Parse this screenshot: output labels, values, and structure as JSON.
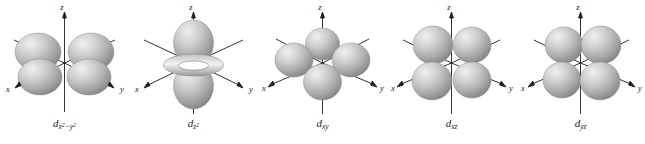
{
  "figure": {
    "caption_style": "italic-serif",
    "background_color": "#ffffff",
    "lobe_fill_light": "#e8e8e8",
    "lobe_fill_mid": "#b4b4b4",
    "lobe_fill_dark": "#8a8a8a",
    "axis_color": "#1c1c1c"
  },
  "axes": {
    "x_label": "x",
    "y_label": "y",
    "z_label": "z"
  },
  "orbitals": [
    {
      "id": "dx2-y2",
      "name": "d-x2-y2-orbital",
      "letter": "d",
      "subscript_main": "x",
      "subscript_sup1": "2",
      "subscript_minus": "−y",
      "subscript_sup2": "2",
      "label_plain": "dx2−y2",
      "lobe_count": 4,
      "plane": "xy",
      "lobes_along_axes": true,
      "has_torus": false
    },
    {
      "id": "dz2",
      "name": "d-z2-orbital",
      "letter": "d",
      "subscript_main": "z",
      "subscript_sup1": "2",
      "subscript_minus": "",
      "subscript_sup2": "",
      "label_plain": "dz2",
      "lobe_count": 2,
      "plane": "z",
      "lobes_along_axes": true,
      "has_torus": true
    },
    {
      "id": "dxy",
      "name": "d-xy-orbital",
      "letter": "d",
      "subscript_main": "xy",
      "subscript_sup1": "",
      "subscript_minus": "",
      "subscript_sup2": "",
      "label_plain": "dxy",
      "lobe_count": 4,
      "plane": "xy",
      "lobes_along_axes": false,
      "has_torus": false
    },
    {
      "id": "dxz",
      "name": "d-xz-orbital",
      "letter": "d",
      "subscript_main": "xz",
      "subscript_sup1": "",
      "subscript_minus": "",
      "subscript_sup2": "",
      "label_plain": "dxz",
      "lobe_count": 4,
      "plane": "xz",
      "lobes_along_axes": false,
      "has_torus": false
    },
    {
      "id": "dyz",
      "name": "d-yz-orbital",
      "letter": "d",
      "subscript_main": "yz",
      "subscript_sup1": "",
      "subscript_minus": "",
      "subscript_sup2": "",
      "label_plain": "dyz",
      "lobe_count": 4,
      "plane": "yz",
      "lobes_along_axes": false,
      "has_torus": false
    }
  ]
}
